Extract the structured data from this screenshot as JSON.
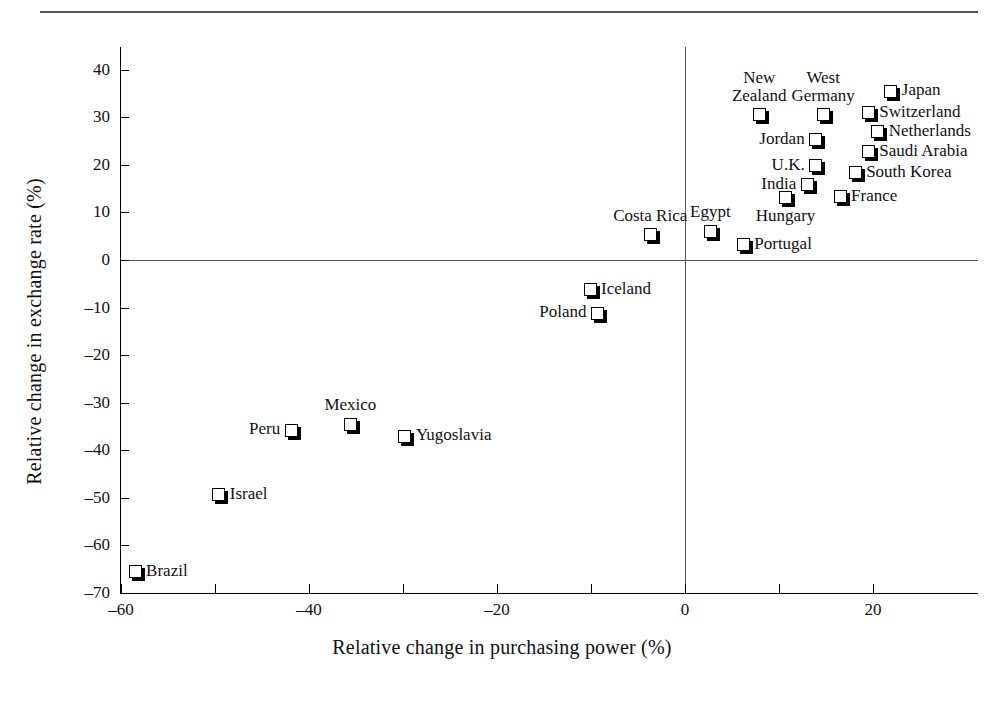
{
  "chart_data": {
    "type": "scatter",
    "title": "",
    "xlabel": "Relative change in purchasing power (%)",
    "ylabel": "Relative change in exchange rate (%)",
    "xlim": [
      -63,
      29
    ],
    "ylim": [
      -70,
      45
    ],
    "xticks": [
      -60,
      -40,
      -20,
      0,
      20
    ],
    "xticklabels": [
      "–60",
      "–40",
      "–20",
      "0",
      "20"
    ],
    "yticks": [
      40,
      30,
      20,
      10,
      0,
      -10,
      -20,
      -30,
      -40,
      -50,
      -60,
      -70
    ],
    "yticklabels": [
      "40",
      "30",
      "20",
      "10",
      "0",
      "–10",
      "–20",
      "–30",
      "–40",
      "–50",
      "–60",
      "–70"
    ],
    "grid": false,
    "legend": "none",
    "reference_lines": [
      {
        "axis": "horizontal",
        "value": 0
      },
      {
        "axis": "vertical",
        "value": 0
      }
    ],
    "marker_style": "white square with drop shadow",
    "points": [
      {
        "label": "Japan",
        "x": 21.9,
        "y": 35.5,
        "label_pos": "right"
      },
      {
        "label": "Switzerland",
        "x": 19.5,
        "y": 31.0,
        "label_pos": "right"
      },
      {
        "label": "Netherlands",
        "x": 20.5,
        "y": 27.0,
        "label_pos": "right"
      },
      {
        "label": "Saudi Arabia",
        "x": 19.5,
        "y": 22.8,
        "label_pos": "right"
      },
      {
        "label": "South Korea",
        "x": 18.1,
        "y": 18.3,
        "label_pos": "right"
      },
      {
        "label": "France",
        "x": 16.5,
        "y": 13.3,
        "label_pos": "right"
      },
      {
        "label": "New Zealand",
        "x": 7.9,
        "y": 30.5,
        "label_pos": "above"
      },
      {
        "label": "West Germany",
        "x": 14.7,
        "y": 30.5,
        "label_pos": "above"
      },
      {
        "label": "Jordan",
        "x": 13.9,
        "y": 25.3,
        "label_pos": "left"
      },
      {
        "label": "U.K.",
        "x": 13.9,
        "y": 19.8,
        "label_pos": "left"
      },
      {
        "label": "India",
        "x": 13.0,
        "y": 15.8,
        "label_pos": "left"
      },
      {
        "label": "Hungary",
        "x": 10.7,
        "y": 13.1,
        "label_pos": "below"
      },
      {
        "label": "Egypt",
        "x": 2.7,
        "y": 6.0,
        "label_pos": "above"
      },
      {
        "label": "Portugal",
        "x": 6.2,
        "y": 3.2,
        "label_pos": "right"
      },
      {
        "label": "Costa Rica",
        "x": -3.7,
        "y": 5.3,
        "label_pos": "above"
      },
      {
        "label": "Iceland",
        "x": -10.1,
        "y": -6.3,
        "label_pos": "right"
      },
      {
        "label": "Poland",
        "x": -9.3,
        "y": -11.2,
        "label_pos": "left"
      },
      {
        "label": "Mexico",
        "x": -35.6,
        "y": -34.5,
        "label_pos": "above"
      },
      {
        "label": "Peru",
        "x": -41.9,
        "y": -35.8,
        "label_pos": "left"
      },
      {
        "label": "Yugoslavia",
        "x": -29.8,
        "y": -37.0,
        "label_pos": "right"
      },
      {
        "label": "Israel",
        "x": -49.6,
        "y": -49.3,
        "label_pos": "right"
      },
      {
        "label": "Brazil",
        "x": -58.5,
        "y": -65.5,
        "label_pos": "right"
      }
    ]
  }
}
